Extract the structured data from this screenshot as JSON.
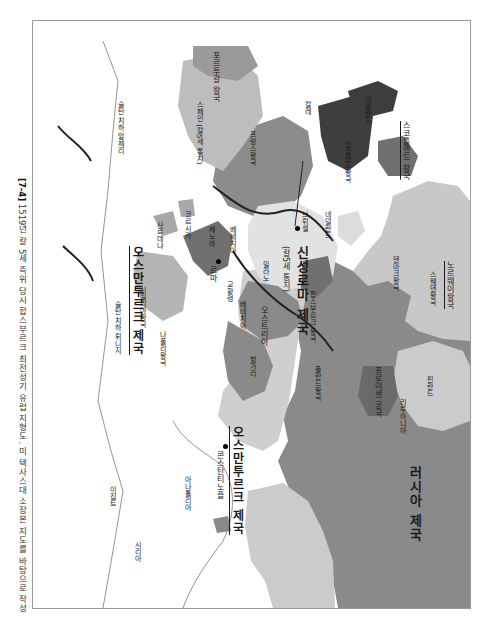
{
  "caption": {
    "figure_number": "[7-4]",
    "text": "1519년 칼 5세 즉위 당시 합스부르크 최전성기 유럽 지형도. 미 텍사스대 소장본 지도를 바탕으로 작성"
  },
  "map": {
    "orientation": "rotated 90° clockwise (north to the right)",
    "colors": {
      "habsburg_dark": "#6e6e6e",
      "habsburg_mid": "#8c8c8c",
      "light_region": "#c4c4c4",
      "lighter_region": "#d6d6d6",
      "very_dark": "#3e3e3e",
      "sea": "#ffffff",
      "border_line": "#222222"
    },
    "labels": {
      "portugal": "포르투갈 왕국",
      "spain": "스페인 (칼5세 통치)",
      "france": "프랑스왕국",
      "england": "잉글랜드왕국",
      "ireland": "아일랜드",
      "scotland": "스코틀랜드 왕국",
      "calais": "칼레",
      "netherlands": "네덜란드",
      "brussels": "브뤼셀",
      "hre": "신성로마 제국",
      "hre_sub": "(칼5세 통치)",
      "milan": "밀라노",
      "austria": "오스트리아",
      "hungary": "헝가리",
      "bohemia": "합스부르크 왕국",
      "poland": "폴란드왕국",
      "prussia": "프로이센 공국",
      "lithuania": "리투아니아",
      "finland": "핀란드",
      "sweden": "스웨덴왕국",
      "norway": "노르웨이왕국",
      "denmark": "덴마크왕국",
      "russia": "러시아 제국",
      "corsica": "코르시카",
      "sardinia": "사르데냐",
      "sicily": "시칠리아왕국",
      "naples": "나폴리왕국",
      "rome": "로마",
      "papal_states": "교황령",
      "genoa": "제노바",
      "venice": "베네치아",
      "ottoman_main": "오스만투르크 제국",
      "ottoman_africa": "오스만투르크 제국",
      "constantinople": "콘스탄티노플",
      "anatolia": "아나톨리아",
      "egypt": "이집트",
      "syria": "시리아",
      "algeria": "술탄 치하 알제리",
      "tunisia": "술탄 치하 튀니지"
    }
  }
}
